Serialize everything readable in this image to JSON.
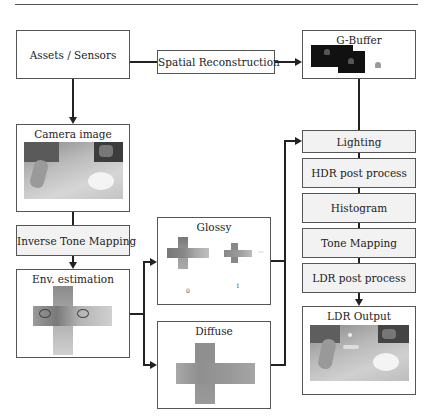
{
  "diagram": {
    "nodes": {
      "assets": {
        "label": "Assets / Sensors"
      },
      "spatial": {
        "label": "Spatial Reconstruction"
      },
      "gbuffer": {
        "label": "G-Buffer"
      },
      "camera": {
        "label": "Camera image"
      },
      "itm": {
        "label": "Inverse Tone Mapping"
      },
      "env": {
        "label": "Env. estimation"
      },
      "glossy": {
        "label": "Glossy",
        "levels": [
          "0",
          "1"
        ],
        "ellipsis": "···"
      },
      "diffuse": {
        "label": "Diffuse"
      },
      "lighting": {
        "label": "Lighting"
      },
      "hdr": {
        "label": "HDR post process"
      },
      "histogram": {
        "label": "Histogram"
      },
      "tonemap": {
        "label": "Tone Mapping"
      },
      "ldrpost": {
        "label": "LDR post process"
      },
      "ldrout": {
        "label": "LDR Output"
      }
    },
    "edges": [
      [
        "Assets / Sensors",
        "Spatial Reconstruction"
      ],
      [
        "Spatial Reconstruction",
        "G-Buffer"
      ],
      [
        "Assets / Sensors",
        "Camera image"
      ],
      [
        "Camera image",
        "Inverse Tone Mapping"
      ],
      [
        "Inverse Tone Mapping",
        "Env. estimation"
      ],
      [
        "Env. estimation",
        "Glossy"
      ],
      [
        "Env. estimation",
        "Diffuse"
      ],
      [
        "G-Buffer",
        "Lighting"
      ],
      [
        "Glossy",
        "Lighting"
      ],
      [
        "Diffuse",
        "Lighting"
      ],
      [
        "Lighting",
        "HDR post process"
      ],
      [
        "HDR post process",
        "Histogram"
      ],
      [
        "Histogram",
        "Tone Mapping"
      ],
      [
        "Tone Mapping",
        "LDR post process"
      ],
      [
        "LDR post process",
        "LDR Output"
      ]
    ],
    "colors": {
      "line": "#222222",
      "border": "#555555",
      "gray_fill": "#f2f2f2"
    }
  }
}
